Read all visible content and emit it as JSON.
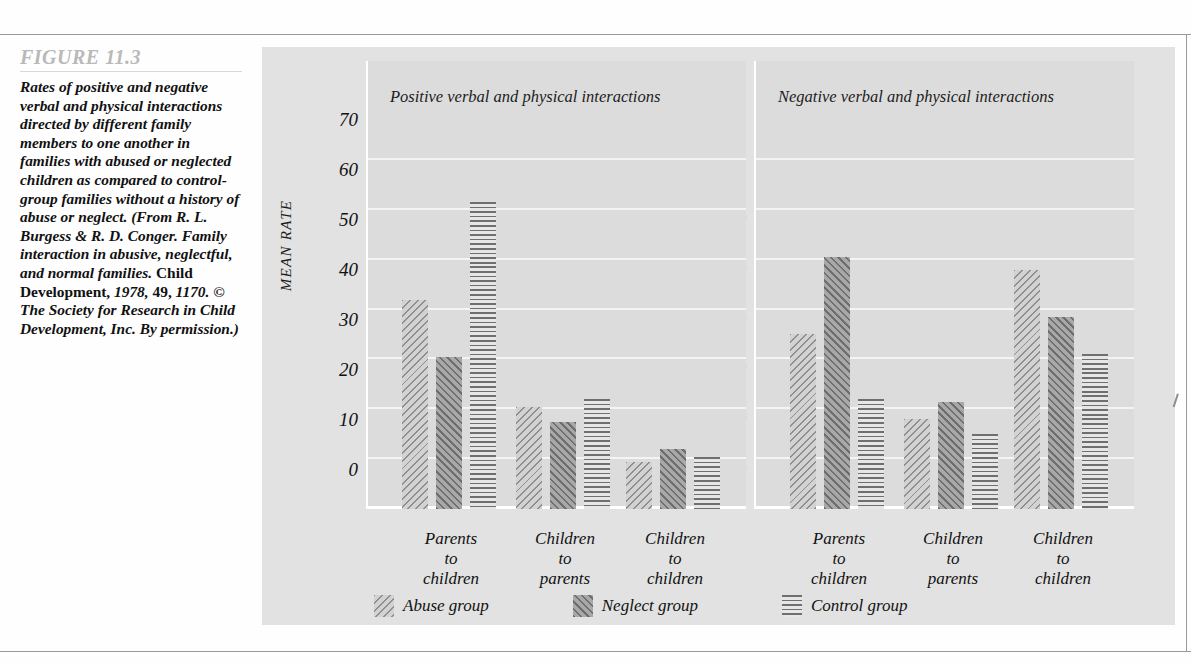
{
  "figure": {
    "label": "FIGURE  11.3",
    "caption_italic_1": "Rates of positive and negative verbal and physical interactions directed by different family members to one another in families with abused or neglected children as compared to control-group families without a history of abuse or neglect. (From R. L. Burgess & R. D. Conger. Family interaction in abusive, neglectful, and normal families. ",
    "caption_bold_journal": "Child Development,",
    "caption_italic_2": " 1978, ",
    "caption_bold_vol": "49,",
    "caption_italic_3": " 1170. © The Society for Research in Child Development, Inc. By permission.)"
  },
  "chart_data": {
    "type": "bar",
    "title": "Rates of positive and negative verbal and physical interactions",
    "ylabel": "MEAN RATE",
    "xlabel": "",
    "ylim": [
      0,
      75
    ],
    "yticks": [
      0,
      10,
      20,
      30,
      40,
      50,
      60,
      70
    ],
    "ytick_labels": [
      "0",
      "10",
      "20",
      "30",
      "40",
      "50",
      "60",
      "70"
    ],
    "grid": true,
    "legend_position": "bottom-left",
    "categories": [
      "Parents to children",
      "Children to parents",
      "Children to children"
    ],
    "category_lines": [
      [
        "Parents",
        "to",
        "children"
      ],
      [
        "Children",
        "to",
        "parents"
      ],
      [
        "Children",
        "to",
        "children"
      ]
    ],
    "legend": [
      {
        "name": "Abuse group",
        "pattern": "diagonal-backslash-light",
        "color": "#d2d2d2"
      },
      {
        "name": "Neglect group",
        "pattern": "diagonal-slash-dark",
        "color": "#a8a8a8"
      },
      {
        "name": "Control group",
        "pattern": "horizontal-lines",
        "color": "#e6e6e6"
      }
    ],
    "panels": [
      {
        "title": "Positive verbal and physical interactions",
        "series": [
          {
            "name": "Abuse group",
            "values": [
              42.0,
              20.5,
              9.5
            ]
          },
          {
            "name": "Neglect group",
            "values": [
              30.5,
              17.5,
              12.0
            ]
          },
          {
            "name": "Control group",
            "values": [
              61.5,
              22.0,
              10.5
            ]
          }
        ]
      },
      {
        "title": "Negative verbal and physical interactions",
        "series": [
          {
            "name": "Abuse group",
            "values": [
              35.0,
              18.0,
              48.0
            ]
          },
          {
            "name": "Neglect group",
            "values": [
              50.5,
              21.5,
              38.5
            ]
          },
          {
            "name": "Control group",
            "values": [
              22.0,
              15.0,
              31.0
            ]
          }
        ]
      }
    ]
  },
  "colors": {
    "card_background": "#e2e2e2",
    "panel_background": "#dcdcdc",
    "gridline": "#f4f4f4",
    "axis": "#ffffff",
    "text": "#111111",
    "figure_label": "#b9b9b9"
  }
}
